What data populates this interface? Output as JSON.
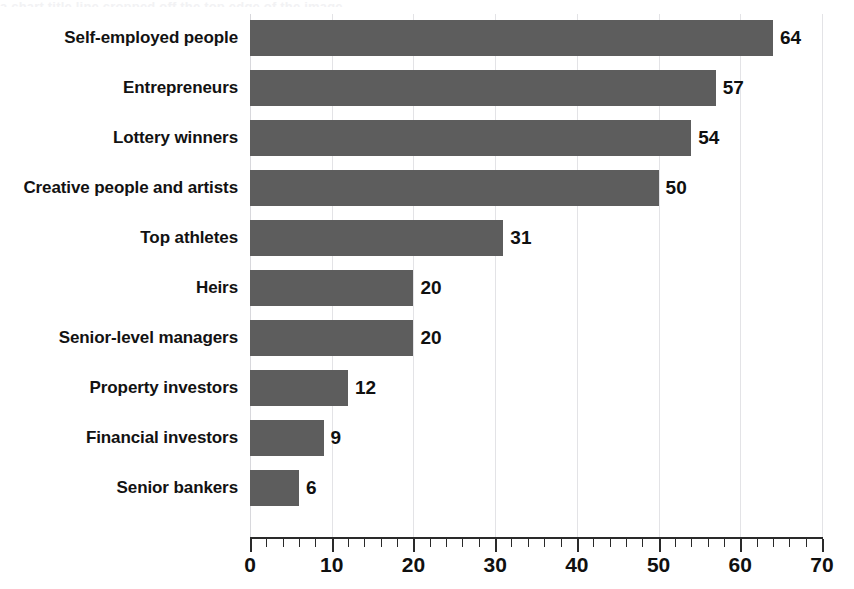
{
  "chart_data": {
    "type": "bar",
    "orientation": "horizontal",
    "title": "",
    "xlabel": "",
    "ylabel": "",
    "xlim": [
      0,
      70
    ],
    "grid": true,
    "legend": "none",
    "x_major_step": 10,
    "x_minor_step": 2,
    "categories": [
      "Self-employed people",
      "Entrepreneurs",
      "Lottery winners",
      "Creative people and artists",
      "Top athletes",
      "Heirs",
      "Senior-level managers",
      "Property investors",
      "Financial investors",
      "Senior bankers"
    ],
    "values": [
      64,
      57,
      54,
      50,
      31,
      20,
      20,
      12,
      9,
      6
    ],
    "value_labels": [
      "64",
      "57",
      "54",
      "50",
      "31",
      "20",
      "20",
      "12",
      "9",
      "6"
    ],
    "tick_labels": [
      "0",
      "10",
      "20",
      "30",
      "40",
      "50",
      "60",
      "70"
    ],
    "tick_values": [
      0,
      10,
      20,
      30,
      40,
      50,
      60,
      70
    ]
  },
  "style": {
    "bar_color": "#5d5d5d",
    "gridline_color": "#e3e3e6",
    "axis_color": "#2a2a2a",
    "text_color": "#101010",
    "background": "#ffffff"
  },
  "title_remnant": {
    "text": "a chart title line cropped off the top edge of the image"
  }
}
